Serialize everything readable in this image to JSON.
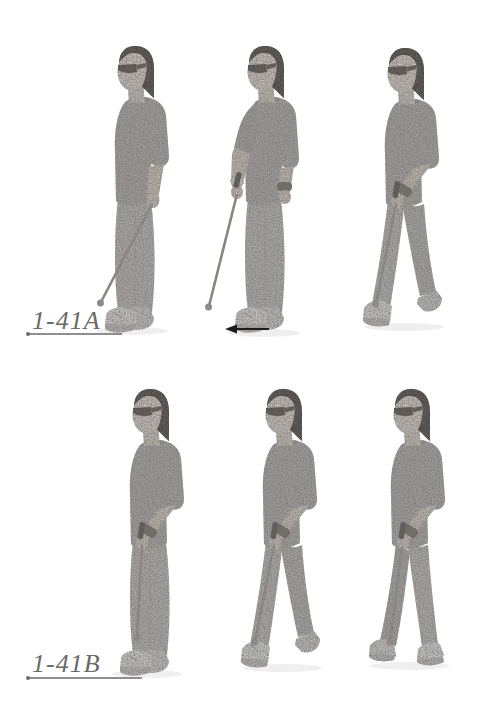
{
  "document": {
    "background_color": "#ffffff",
    "label_color": "#6a6a6a",
    "underline_color": "#6a6a6a",
    "arrow_color": "#1c1c1c",
    "rows": {
      "a": {
        "label": "1-41A",
        "figures": [
          {
            "icon": "person-standing-cane-at-side-icon"
          },
          {
            "icon": "person-standing-cane-extended-forward-icon"
          },
          {
            "icon": "person-walking-cane-forward-icon"
          }
        ],
        "direction_icon": "left-arrow-icon"
      },
      "b": {
        "label": "1-41B",
        "figures": [
          {
            "icon": "person-standing-cane-down-front-icon"
          },
          {
            "icon": "person-walking-cane-forward-icon"
          },
          {
            "icon": "person-walking-cane-step-icon"
          }
        ]
      }
    }
  }
}
